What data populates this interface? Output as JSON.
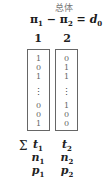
{
  "title": "总体",
  "formula": {
    "a": "π",
    "a_sub": "1",
    "op": " − ",
    "b": "π",
    "b_sub": "2",
    "eq": " = ",
    "c": "d",
    "c_sub": "0"
  },
  "columns": [
    {
      "header": "1",
      "values_top": [
        "1",
        "0",
        "1"
      ],
      "ellipsis": "⋮",
      "values_bottom": [
        "0",
        "0",
        "1"
      ],
      "t": "t",
      "t_sub": "1",
      "n": "n",
      "n_sub": "1",
      "p": "p",
      "p_sub": "1"
    },
    {
      "header": "2",
      "values_top": [
        "0",
        "1",
        "1"
      ],
      "ellipsis": "⋮",
      "values_bottom": [
        "1",
        "0",
        "0"
      ],
      "t": "t",
      "t_sub": "2",
      "n": "n",
      "n_sub": "2",
      "p": "p",
      "p_sub": "2"
    }
  ],
  "sum_symbol": "Σ"
}
